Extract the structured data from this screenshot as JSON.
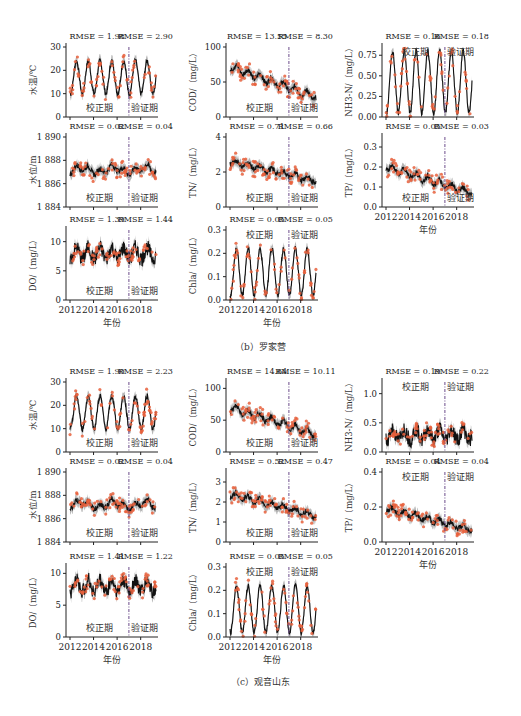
{
  "figure": {
    "captions": [
      "（b）罗家营",
      "（c）观音山东"
    ],
    "xlabel": "年份",
    "period_labels": {
      "calibration": "校正期",
      "validation": "验证期"
    },
    "colors": {
      "simulated": "#111111",
      "band": "#7a7a7a",
      "observed": "#e8603c",
      "divider": "#6b4c8a",
      "axis": "#222222"
    }
  },
  "chart_data": [
    {
      "panel": "b",
      "site": "罗家营",
      "type": "line",
      "ylabel": "水温/℃",
      "ylim": [
        0,
        30
      ],
      "yticks": [
        "0",
        "10",
        "20",
        "30"
      ],
      "rmse_calibration": "RMSE = 1.98",
      "rmse_validation": "RMSE = 2.90",
      "x": [
        2012,
        2019.3
      ],
      "xticks": [
        "2012",
        "2014",
        "2016",
        "2018"
      ],
      "divider_year": 2017,
      "pattern": "seasonal",
      "series": [
        {
          "name": "simulated",
          "min": 10,
          "max": 24
        },
        {
          "name": "observed",
          "min": 8,
          "max": 27
        }
      ]
    },
    {
      "panel": "b",
      "site": "罗家营",
      "type": "line",
      "ylabel": "COD/（mg/L）",
      "ylim": [
        0,
        100
      ],
      "yticks": [
        "0",
        "50",
        "100"
      ],
      "rmse_calibration": "RMSE = 13.55",
      "rmse_validation": "RMSE = 8.30",
      "x": [
        2012,
        2019.3
      ],
      "xticks": [
        "2012",
        "2014",
        "2016",
        "2018"
      ],
      "divider_year": 2017,
      "pattern": "declining",
      "series": [
        {
          "name": "simulated",
          "start": 72,
          "end": 28
        },
        {
          "name": "observed",
          "start": 85,
          "end": 25
        }
      ]
    },
    {
      "panel": "b",
      "site": "罗家营",
      "type": "line",
      "ylabel": "NH3-N/（mg/L）",
      "ylim": [
        0,
        0.85
      ],
      "yticks": [
        "0.00",
        "0.25",
        "0.50",
        "0.75"
      ],
      "rmse_calibration": "RMSE = 0.16",
      "rmse_validation": "RMSE = 0.18",
      "x": [
        2012,
        2019.3
      ],
      "xticks": [
        "2012",
        "2014",
        "2016",
        "2018"
      ],
      "divider_year": 2017,
      "pattern": "seasonal",
      "series": [
        {
          "name": "simulated",
          "min": 0.05,
          "max": 0.8
        },
        {
          "name": "observed",
          "min": 0.02,
          "max": 0.7
        }
      ]
    },
    {
      "panel": "b",
      "site": "罗家营",
      "type": "line",
      "ylabel": "水位/m",
      "ylim": [
        1884,
        1890
      ],
      "yticks": [
        "1 884",
        "1 886",
        "1 888",
        "1 890"
      ],
      "rmse_calibration": "RMSE = 0.02",
      "rmse_validation": "RMSE = 0.04",
      "x": [
        2012,
        2019.3
      ],
      "xticks": [
        "2012",
        "2014",
        "2016",
        "2018"
      ],
      "divider_year": 2017,
      "pattern": "flat",
      "series": [
        {
          "name": "simulated",
          "mean": 1887.2
        },
        {
          "name": "observed",
          "mean": 1887.2
        }
      ]
    },
    {
      "panel": "b",
      "site": "罗家营",
      "type": "line",
      "ylabel": "TN/（mg/L）",
      "ylim": [
        0,
        4
      ],
      "yticks": [
        "0",
        "2",
        "4"
      ],
      "rmse_calibration": "RMSE = 0.71",
      "rmse_validation": "RMSE = 0.66",
      "x": [
        2012,
        2019.3
      ],
      "xticks": [
        "2012",
        "2014",
        "2016",
        "2018"
      ],
      "divider_year": 2017,
      "pattern": "declining",
      "series": [
        {
          "name": "simulated",
          "start": 2.6,
          "end": 1.5
        },
        {
          "name": "observed",
          "start": 2.3,
          "end": 1.4
        }
      ]
    },
    {
      "panel": "b",
      "site": "罗家营",
      "type": "line",
      "ylabel": "TP/（mg/L）",
      "ylim": [
        0,
        0.35
      ],
      "yticks": [
        "0.0",
        "0.1",
        "0.2",
        "0.3"
      ],
      "rmse_calibration": "RMSE = 0.05",
      "rmse_validation": "RMSE = 0.03",
      "x": [
        2012,
        2019.3
      ],
      "xticks": [
        "2012",
        "2014",
        "2016",
        "2018"
      ],
      "divider_year": 2017,
      "pattern": "declining",
      "series": [
        {
          "name": "simulated",
          "start": 0.2,
          "end": 0.07
        },
        {
          "name": "observed",
          "start": 0.22,
          "end": 0.07
        }
      ]
    },
    {
      "panel": "b",
      "site": "罗家营",
      "type": "line",
      "ylabel": "DO/（mg/L）",
      "ylim": [
        0,
        12
      ],
      "yticks": [
        "0",
        "5",
        "10"
      ],
      "rmse_calibration": "RMSE = 1.39",
      "rmse_validation": "RMSE = 1.44",
      "x": [
        2012,
        2019.3
      ],
      "xticks": [
        "2012",
        "2014",
        "2016",
        "2018"
      ],
      "divider_year": 2017,
      "pattern": "noisy",
      "series": [
        {
          "name": "simulated",
          "mean": 8
        },
        {
          "name": "observed",
          "mean": 7.5
        }
      ]
    },
    {
      "panel": "b",
      "site": "罗家营",
      "type": "line",
      "ylabel": "Chla/（mg/L）",
      "ylim": [
        0,
        0.3
      ],
      "yticks": [
        "0.0",
        "0.1",
        "0.2",
        "0.3"
      ],
      "rmse_calibration": "RMSE = 0.05",
      "rmse_validation": "RMSE = 0.05",
      "x": [
        2012,
        2019.3
      ],
      "xticks": [
        "2012",
        "2014",
        "2016",
        "2018"
      ],
      "divider_year": 2017,
      "pattern": "seasonal",
      "series": [
        {
          "name": "simulated",
          "min": 0.02,
          "max": 0.22
        },
        {
          "name": "observed",
          "min": 0.01,
          "max": 0.2
        }
      ]
    },
    {
      "panel": "c",
      "site": "观音山东",
      "type": "line",
      "ylabel": "水温/℃",
      "ylim": [
        0,
        30
      ],
      "yticks": [
        "0",
        "10",
        "20",
        "30"
      ],
      "rmse_calibration": "RMSE = 1.90",
      "rmse_validation": "RMSE = 2.23",
      "x": [
        2012,
        2019.3
      ],
      "xticks": [
        "2012",
        "2014",
        "2016",
        "2018"
      ],
      "divider_year": 2017,
      "pattern": "seasonal",
      "series": [
        {
          "name": "simulated",
          "min": 10,
          "max": 24
        },
        {
          "name": "observed",
          "min": 8,
          "max": 27
        }
      ]
    },
    {
      "panel": "c",
      "site": "观音山东",
      "type": "line",
      "ylabel": "COD/（mg/L）",
      "ylim": [
        0,
        110
      ],
      "yticks": [
        "0",
        "50",
        "100"
      ],
      "rmse_calibration": "RMSE = 14.64",
      "rmse_validation": "RMSE = 10.11",
      "x": [
        2012,
        2019.3
      ],
      "xticks": [
        "2012",
        "2014",
        "2016",
        "2018"
      ],
      "divider_year": 2017,
      "pattern": "declining",
      "series": [
        {
          "name": "simulated",
          "start": 70,
          "end": 28
        },
        {
          "name": "observed",
          "start": 85,
          "end": 28
        }
      ]
    },
    {
      "panel": "c",
      "site": "观音山东",
      "type": "line",
      "ylabel": "NH3-N/（mg/L）",
      "ylim": [
        0,
        1.2
      ],
      "yticks": [
        "0.0",
        "0.5",
        "1.0"
      ],
      "rmse_calibration": "RMSE = 0.19",
      "rmse_validation": "RMSE = 0.22",
      "x": [
        2012,
        2019.3
      ],
      "xticks": [
        "2012",
        "2014",
        "2016",
        "2018"
      ],
      "divider_year": 2017,
      "pattern": "noisy",
      "series": [
        {
          "name": "simulated",
          "mean": 0.3
        },
        {
          "name": "observed",
          "mean": 0.3
        }
      ]
    },
    {
      "panel": "c",
      "site": "观音山东",
      "type": "line",
      "ylabel": "水位/m",
      "ylim": [
        1884,
        1890
      ],
      "yticks": [
        "1 884",
        "1 886",
        "1 888",
        "1 890"
      ],
      "rmse_calibration": "RMSE = 0.02",
      "rmse_validation": "RMSE = 0.04",
      "x": [
        2012,
        2019.3
      ],
      "xticks": [
        "2012",
        "2014",
        "2016",
        "2018"
      ],
      "divider_year": 2017,
      "pattern": "flat",
      "series": [
        {
          "name": "simulated",
          "mean": 1887.2
        },
        {
          "name": "observed",
          "mean": 1887.2
        }
      ]
    },
    {
      "panel": "c",
      "site": "观音山东",
      "type": "line",
      "ylabel": "TN/（mg/L）",
      "ylim": [
        0,
        3.5
      ],
      "yticks": [
        "0",
        "1",
        "2",
        "3"
      ],
      "rmse_calibration": "RMSE = 0.52",
      "rmse_validation": "RMSE = 0.47",
      "x": [
        2012,
        2019.3
      ],
      "xticks": [
        "2012",
        "2014",
        "2016",
        "2018"
      ],
      "divider_year": 2017,
      "pattern": "declining",
      "series": [
        {
          "name": "simulated",
          "start": 2.4,
          "end": 1.3
        },
        {
          "name": "observed",
          "start": 2.2,
          "end": 1.2
        }
      ]
    },
    {
      "panel": "c",
      "site": "观音山东",
      "type": "line",
      "ylabel": "TP/（mg/L）",
      "ylim": [
        0,
        0.4
      ],
      "yticks": [
        "0.0",
        "0.2",
        "0.4"
      ],
      "rmse_calibration": "RMSE = 0.04",
      "rmse_validation": "RMSE = 0.04",
      "x": [
        2012,
        2019.3
      ],
      "xticks": [
        "2012",
        "2014",
        "2016",
        "2018"
      ],
      "divider_year": 2017,
      "pattern": "declining",
      "series": [
        {
          "name": "simulated",
          "start": 0.19,
          "end": 0.07
        },
        {
          "name": "observed",
          "start": 0.18,
          "end": 0.05
        }
      ]
    },
    {
      "panel": "c",
      "site": "观音山东",
      "type": "line",
      "ylabel": "DO/（mg/L）",
      "ylim": [
        0,
        11
      ],
      "yticks": [
        "0",
        "5",
        "10"
      ],
      "rmse_calibration": "RMSE = 1.41",
      "rmse_validation": "RMSE = 1.22",
      "x": [
        2012,
        2019.3
      ],
      "xticks": [
        "2012",
        "2014",
        "2016",
        "2018"
      ],
      "divider_year": 2017,
      "pattern": "noisy",
      "series": [
        {
          "name": "simulated",
          "mean": 8
        },
        {
          "name": "observed",
          "mean": 7.5
        }
      ]
    },
    {
      "panel": "c",
      "site": "观音山东",
      "type": "line",
      "ylabel": "Chla/（mg/L）",
      "ylim": [
        0,
        0.3
      ],
      "yticks": [
        "0.0",
        "0.1",
        "0.2",
        "0.3"
      ],
      "rmse_calibration": "RMSE = 0.05",
      "rmse_validation": "RMSE = 0.05",
      "x": [
        2012,
        2019.3
      ],
      "xticks": [
        "2012",
        "2014",
        "2016",
        "2018"
      ],
      "divider_year": 2017,
      "pattern": "seasonal",
      "series": [
        {
          "name": "simulated",
          "min": 0.02,
          "max": 0.22
        },
        {
          "name": "observed",
          "min": 0.01,
          "max": 0.2
        }
      ]
    }
  ],
  "layout": [
    {
      "x": 66,
      "y": 43,
      "w": 92,
      "h": 74,
      "showX": false,
      "periodPos": "bottom"
    },
    {
      "x": 226,
      "y": 43,
      "w": 92,
      "h": 74,
      "showX": false,
      "periodPos": "bottom"
    },
    {
      "x": 382,
      "y": 43,
      "w": 92,
      "h": 74,
      "showX": false,
      "periodPos": "top"
    },
    {
      "x": 66,
      "y": 133,
      "w": 92,
      "h": 74,
      "showX": false,
      "periodPos": "bottom"
    },
    {
      "x": 226,
      "y": 133,
      "w": 92,
      "h": 74,
      "showX": false,
      "periodPos": "bottom"
    },
    {
      "x": 382,
      "y": 133,
      "w": 92,
      "h": 74,
      "showX": true,
      "periodPos": "bottom"
    },
    {
      "x": 66,
      "y": 226,
      "w": 92,
      "h": 74,
      "showX": true,
      "periodPos": "bottom"
    },
    {
      "x": 226,
      "y": 226,
      "w": 92,
      "h": 74,
      "showX": true,
      "periodPos": "top"
    },
    {
      "x": 66,
      "y": 378,
      "w": 92,
      "h": 74,
      "showX": false,
      "periodPos": "bottom"
    },
    {
      "x": 226,
      "y": 378,
      "w": 92,
      "h": 74,
      "showX": false,
      "periodPos": "bottom"
    },
    {
      "x": 382,
      "y": 378,
      "w": 92,
      "h": 74,
      "showX": false,
      "periodPos": "top"
    },
    {
      "x": 66,
      "y": 468,
      "w": 92,
      "h": 74,
      "showX": false,
      "periodPos": "bottom"
    },
    {
      "x": 226,
      "y": 468,
      "w": 92,
      "h": 74,
      "showX": false,
      "periodPos": "bottom"
    },
    {
      "x": 382,
      "y": 468,
      "w": 92,
      "h": 74,
      "showX": true,
      "periodPos": "top"
    },
    {
      "x": 66,
      "y": 563,
      "w": 92,
      "h": 74,
      "showX": true,
      "periodPos": "bottom"
    },
    {
      "x": 226,
      "y": 563,
      "w": 92,
      "h": 74,
      "showX": true,
      "periodPos": "top"
    }
  ]
}
